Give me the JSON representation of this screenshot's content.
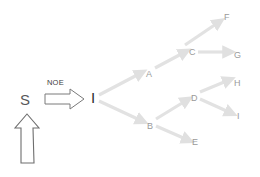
{
  "diagram": {
    "background_color": "#ffffff",
    "source": {
      "label": "S",
      "color": "#58585a",
      "x": 20,
      "y": 92
    },
    "up_arrow": {
      "icon": "up-arrow-outline-icon",
      "stroke_color": "#6e6e6e",
      "fill_color": "#ffffff"
    },
    "transfer_arrow": {
      "label": "NOE",
      "label_color": "#3c3c3c",
      "icon": "right-arrow-outline-icon",
      "stroke_color": "#7a7a7a",
      "fill_color": "#ffffff",
      "label_x": 47,
      "label_y": 79
    },
    "root": {
      "label": "I",
      "color": "#303030",
      "x": 91,
      "y": 90
    },
    "tree": {
      "edge_color": "#e2e2e2",
      "node_label_color": "#9a9a9a",
      "nodes": [
        {
          "id": "A",
          "label": "A",
          "x": 146,
          "y": 70
        },
        {
          "id": "B",
          "label": "B",
          "x": 147,
          "y": 122
        },
        {
          "id": "C",
          "label": "C",
          "x": 189,
          "y": 48
        },
        {
          "id": "D",
          "label": "D",
          "x": 191,
          "y": 94
        },
        {
          "id": "E",
          "label": "E",
          "x": 192,
          "y": 138
        },
        {
          "id": "F",
          "label": "F",
          "x": 224,
          "y": 13
        },
        {
          "id": "G",
          "label": "G",
          "x": 234,
          "y": 51
        },
        {
          "id": "H",
          "label": "H",
          "x": 234,
          "y": 79
        },
        {
          "id": "I",
          "label": "I",
          "x": 237,
          "y": 112
        }
      ],
      "edges": [
        {
          "from": "I",
          "to": "A"
        },
        {
          "from": "I",
          "to": "B"
        },
        {
          "from": "A",
          "to": "C"
        },
        {
          "from": "B",
          "to": "D"
        },
        {
          "from": "B",
          "to": "E"
        },
        {
          "from": "C",
          "to": "F"
        },
        {
          "from": "C",
          "to": "G"
        },
        {
          "from": "D",
          "to": "H"
        },
        {
          "from": "D",
          "to": "I2"
        }
      ]
    }
  }
}
